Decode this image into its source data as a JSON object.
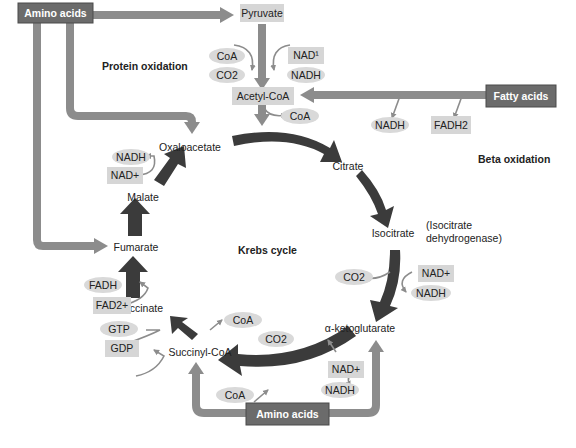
{
  "colors": {
    "dark_box": "#6b6b6b",
    "dark_box_border": "#4a4a4a",
    "pathway_arrow": "#8c8c8c",
    "cycle_arrow": "#3b3b3b",
    "light_box": "#d6d6d6",
    "ellipse": "#d9d9d9",
    "text": "#222222",
    "box_text": "#ffffff"
  },
  "sources": {
    "amino_acids_top": "Amino acids",
    "fatty_acids": "Fatty acids",
    "amino_acids_bottom": "Amino acids"
  },
  "sections": {
    "protein_oxidation": "Protein oxidation",
    "beta_oxidation": "Beta oxidation",
    "krebs_cycle": "Krebs cycle"
  },
  "entry": {
    "pyruvate": "Pyruvate",
    "acetyl_coa": "Acetyl-CoA",
    "coa_in": "CoA",
    "co2_out": "CO2",
    "nad_in": "NAD¹",
    "nadh_out": "NADH",
    "coa_released": "CoA"
  },
  "beta": {
    "nadh": "NADH",
    "fadh2": "FADH2"
  },
  "intermediates": {
    "oxaloacetate": "Oxaloacetate",
    "citrate": "Citrate",
    "isocitrate": "Isocitrate",
    "isocitrate_enzyme_line1": "(Isocitrate",
    "isocitrate_enzyme_line2": "dehydrogenase)",
    "alpha_ketoglutarate": "α-ketoglutarate",
    "succinyl_coa": "Succinyl-CoA",
    "succinate": "Succinate",
    "fumarate": "Fumarate",
    "malate": "Malate"
  },
  "cofactors": {
    "malate_nadh": "NADH",
    "malate_nad": "NAD+",
    "iso_co2": "CO2",
    "iso_nad": "NAD+",
    "iso_nadh": "NADH",
    "akg_co2": "CO2",
    "akg_nad": "NAD+",
    "akg_nadh": "NADH",
    "akg_coa": "CoA",
    "succ_coa": "CoA",
    "succ_gtp": "GTP",
    "succ_gdp": "GDP",
    "succinate_fadh": "FADH",
    "succinate_fad": "FAD2+"
  }
}
